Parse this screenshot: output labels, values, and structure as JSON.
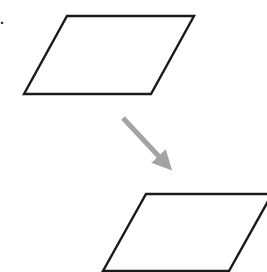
{
  "diagram": {
    "type": "translation",
    "label_fragment": "·",
    "colors": {
      "background": "#ffffff",
      "shape_stroke": "#1a1a1a",
      "arrow": "#a3a3a3"
    },
    "shapes": [
      {
        "name": "original-parallelogram",
        "points": "67,16 194,16 151,94 24,94"
      },
      {
        "name": "translated-parallelogram",
        "points": "146,194 272,194 229,271 103,271"
      }
    ],
    "arrow": {
      "from": [
        123,
        118
      ],
      "to": [
        172,
        170
      ]
    }
  }
}
